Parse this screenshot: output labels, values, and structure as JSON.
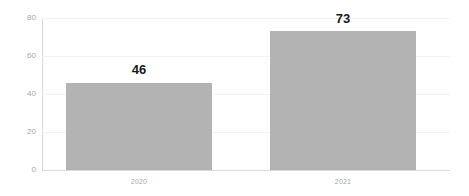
{
  "chart_data": {
    "type": "bar",
    "title": "",
    "subtitle": "",
    "xlabel": "",
    "ylabel": "",
    "categories": [
      "2020",
      "2021"
    ],
    "values": [
      46,
      73
    ],
    "data_labels": [
      "46",
      "73"
    ],
    "series": [
      {
        "name": "",
        "values": [
          46,
          73
        ]
      }
    ],
    "ylim": [
      0,
      80
    ],
    "y_ticks": [
      0,
      20,
      40,
      60,
      80
    ],
    "y_tick_labels": [
      "0",
      "20",
      "40",
      "60",
      "80"
    ],
    "x_tick_labels": [
      "2020",
      "2021"
    ],
    "grid": true,
    "grid_axis": "y",
    "legend": false,
    "legend_position": "none",
    "colors": {
      "bar": "#b3b3b3",
      "data_label": "#1a1a1a",
      "tick_label": "#a6a6a6",
      "gridline": "#f2f2f2",
      "axis_line": "#d9d9d9",
      "background": "#ffffff"
    }
  }
}
